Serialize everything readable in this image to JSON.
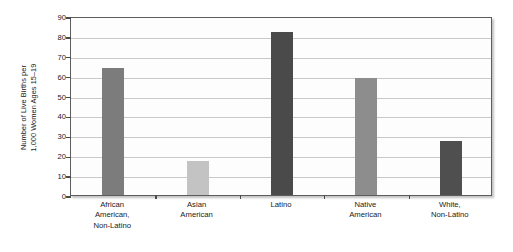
{
  "chart_data": {
    "type": "bar",
    "title": "",
    "subtitle": "",
    "xlabel": "",
    "ylabel": "Number of Live Births per 1,000 Women Ages 15–19",
    "ylabel_lines": [
      "Number of Live Births per",
      "1,000 Women Ages 15–19"
    ],
    "categories": [
      "African American, Non-Latino",
      "Asian American",
      "Latino",
      "Native American",
      "White, Non-Latino"
    ],
    "category_lines": [
      [
        "African",
        "American,",
        "Non-Latino"
      ],
      [
        "Asian",
        "American"
      ],
      [
        "Latino"
      ],
      [
        "Native",
        "American"
      ],
      [
        "White,",
        "Non-Latino"
      ]
    ],
    "values": [
      64,
      17,
      82,
      59,
      27
    ],
    "bar_colors": [
      "#7c7c7c",
      "#c3c3c3",
      "#4a4a4a",
      "#8d8d8d",
      "#4f4f4f"
    ],
    "ylim": [
      0,
      90
    ],
    "yticks": [
      0,
      10,
      20,
      30,
      40,
      50,
      60,
      70,
      80,
      90
    ],
    "ytick_labels": [
      "0",
      "10",
      "20",
      "30",
      "40",
      "50",
      "60",
      "70",
      "80",
      "90"
    ],
    "grid": true,
    "grid_axis": "y",
    "legend": false,
    "legend_position": "none",
    "plot_background": "#fdfdfd",
    "frame_color": "#5d5d5d",
    "gridline_color": "#c9c9c9",
    "text_color": "#1a1a1a"
  }
}
